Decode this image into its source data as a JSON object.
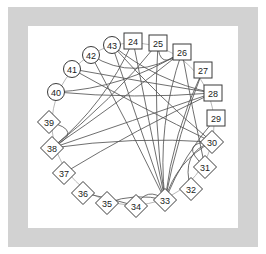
{
  "figure": {
    "background_color": "#ffffff",
    "mat_color": "#d2d2d2",
    "edge_color": "#555555",
    "node_stroke_color": "#3a3a3a",
    "ring_color": "#b9b9b9"
  },
  "chart_data": {
    "type": "diagram",
    "layout": "circular",
    "title": "",
    "center": {
      "x": 133,
      "y": 124
    },
    "radius": 81,
    "nodes": [
      {
        "id": "24",
        "label": "24",
        "shape": "square",
        "x": 133,
        "y": 41
      },
      {
        "id": "25",
        "label": "25",
        "shape": "square",
        "x": 158,
        "y": 43
      },
      {
        "id": "26",
        "label": "26",
        "shape": "square",
        "x": 182,
        "y": 52
      },
      {
        "id": "27",
        "label": "27",
        "shape": "square",
        "x": 203,
        "y": 70
      },
      {
        "id": "28",
        "label": "28",
        "shape": "square",
        "x": 213,
        "y": 93
      },
      {
        "id": "29",
        "label": "29",
        "shape": "square",
        "x": 216,
        "y": 118
      },
      {
        "id": "30",
        "label": "30",
        "shape": "diamond",
        "x": 212,
        "y": 142
      },
      {
        "id": "31",
        "label": "31",
        "shape": "diamond",
        "x": 205,
        "y": 167
      },
      {
        "id": "32",
        "label": "32",
        "shape": "diamond",
        "x": 191,
        "y": 189
      },
      {
        "id": "33",
        "label": "33",
        "shape": "diamond",
        "x": 165,
        "y": 200
      },
      {
        "id": "34",
        "label": "34",
        "shape": "diamond",
        "x": 136,
        "y": 206
      },
      {
        "id": "35",
        "label": "35",
        "shape": "diamond",
        "x": 107,
        "y": 203
      },
      {
        "id": "36",
        "label": "36",
        "shape": "diamond",
        "x": 83,
        "y": 193
      },
      {
        "id": "37",
        "label": "37",
        "shape": "diamond",
        "x": 64,
        "y": 173
      },
      {
        "id": "38",
        "label": "38",
        "shape": "diamond",
        "x": 52,
        "y": 148
      },
      {
        "id": "39",
        "label": "39",
        "shape": "diamond",
        "x": 49,
        "y": 122
      },
      {
        "id": "40",
        "label": "40",
        "shape": "circle",
        "x": 56,
        "y": 92
      },
      {
        "id": "41",
        "label": "41",
        "shape": "circle",
        "x": 72,
        "y": 69
      },
      {
        "id": "42",
        "label": "42",
        "shape": "circle",
        "x": 91,
        "y": 55
      },
      {
        "id": "43",
        "label": "43",
        "shape": "circle",
        "x": 112,
        "y": 45
      }
    ],
    "edges": [
      {
        "source": "43",
        "target": "33"
      },
      {
        "source": "43",
        "target": "30"
      },
      {
        "source": "43",
        "target": "28"
      },
      {
        "source": "42",
        "target": "33"
      },
      {
        "source": "42",
        "target": "26"
      },
      {
        "source": "41",
        "target": "28"
      },
      {
        "source": "41",
        "target": "30"
      },
      {
        "source": "40",
        "target": "28"
      },
      {
        "source": "40",
        "target": "26"
      },
      {
        "source": "39",
        "target": "38"
      },
      {
        "source": "38",
        "target": "28"
      },
      {
        "source": "38",
        "target": "26"
      },
      {
        "source": "38",
        "target": "25"
      },
      {
        "source": "38",
        "target": "24"
      },
      {
        "source": "37",
        "target": "28"
      },
      {
        "source": "36",
        "target": "34"
      },
      {
        "source": "35",
        "target": "33"
      },
      {
        "source": "34",
        "target": "33"
      },
      {
        "source": "33",
        "target": "25"
      },
      {
        "source": "33",
        "target": "26"
      },
      {
        "source": "33",
        "target": "24"
      },
      {
        "source": "33",
        "target": "27"
      },
      {
        "source": "33",
        "target": "30"
      },
      {
        "source": "32",
        "target": "30"
      },
      {
        "source": "31",
        "target": "30"
      },
      {
        "source": "31",
        "target": "26"
      },
      {
        "source": "29",
        "target": "33"
      },
      {
        "source": "27",
        "target": "33"
      },
      {
        "source": "26",
        "target": "25"
      },
      {
        "source": "30",
        "target": "38"
      }
    ],
    "node_count": 20,
    "edge_count": 30,
    "id_range": [
      24,
      43
    ],
    "shape_legend": {
      "circle": "nodes 40-43",
      "square": "nodes 24-29",
      "diamond": "nodes 30-39"
    }
  }
}
